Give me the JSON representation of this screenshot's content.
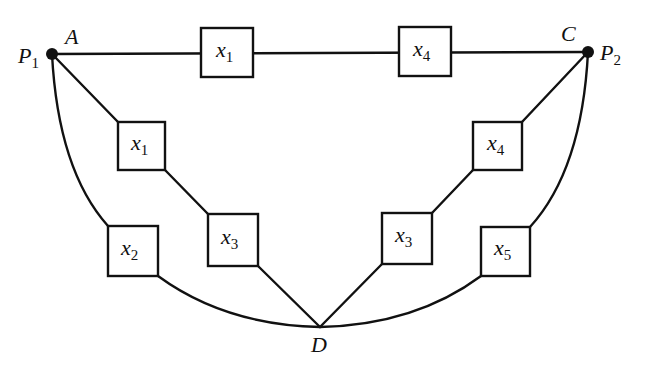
{
  "diagram": {
    "type": "reliability-network",
    "nodes": {
      "A": {
        "label": "A",
        "terminal_label": "P",
        "terminal_sub": "1"
      },
      "C": {
        "label": "C",
        "terminal_label": "P",
        "terminal_sub": "2"
      },
      "D": {
        "label": "D"
      }
    },
    "boxes": [
      {
        "id": "top-x1",
        "var": "x",
        "sub": "1",
        "path": "A-C top"
      },
      {
        "id": "top-x4",
        "var": "x",
        "sub": "4",
        "path": "A-C top"
      },
      {
        "id": "left-diag-x1",
        "var": "x",
        "sub": "1",
        "path": "A-D diagonal"
      },
      {
        "id": "left-diag-x3",
        "var": "x",
        "sub": "3",
        "path": "A-D diagonal"
      },
      {
        "id": "left-arc-x2",
        "var": "x",
        "sub": "2",
        "path": "A-D arc"
      },
      {
        "id": "right-diag-x4",
        "var": "x",
        "sub": "4",
        "path": "C-D diagonal"
      },
      {
        "id": "right-diag-x3",
        "var": "x",
        "sub": "3",
        "path": "C-D diagonal"
      },
      {
        "id": "right-arc-x5",
        "var": "x",
        "sub": "5",
        "path": "C-D arc"
      }
    ],
    "colors": {
      "stroke": "#111111",
      "background": "#ffffff"
    }
  }
}
